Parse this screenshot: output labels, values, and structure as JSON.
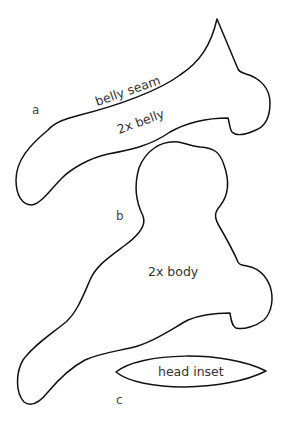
{
  "diagram": {
    "type": "sewing-pattern",
    "stroke_color": "#111111",
    "text_color": "#333333",
    "background": "#ffffff",
    "pieces": [
      {
        "id": "a",
        "letter": "a",
        "labels": [
          "belly seam",
          "2x belly"
        ]
      },
      {
        "id": "b",
        "letter": "b",
        "labels": [
          "2x body"
        ]
      },
      {
        "id": "c",
        "letter": "c",
        "labels": [
          "head inset"
        ]
      }
    ]
  }
}
